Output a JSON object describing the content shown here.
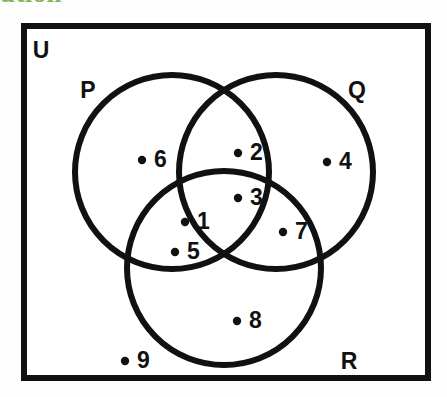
{
  "heading": {
    "clipped_text": "ution",
    "color": "#7aa845"
  },
  "diagram": {
    "type": "venn-3-set",
    "universal_set": {
      "label": "U",
      "border_color": "#111111"
    },
    "stroke_color": "#111111",
    "fill_color": "#ffffff",
    "sets": [
      {
        "id": "P",
        "label": "P",
        "cx": 172,
        "cy": 172,
        "r": 97
      },
      {
        "id": "Q",
        "label": "Q",
        "cx": 276,
        "cy": 172,
        "r": 97
      },
      {
        "id": "R",
        "label": "R",
        "cx": 224,
        "cy": 268,
        "r": 97
      }
    ],
    "set_label_positions": [
      {
        "label": "P",
        "x": 88,
        "y": 92
      },
      {
        "label": "Q",
        "x": 357,
        "y": 92
      },
      {
        "label": "R",
        "x": 349,
        "y": 363
      },
      {
        "label": "U",
        "x": 41,
        "y": 52
      }
    ],
    "elements": [
      {
        "value": "1",
        "region": "P-and-R-only",
        "x": 185,
        "y": 222
      },
      {
        "value": "2",
        "region": "P-and-Q-only",
        "x": 238,
        "y": 153
      },
      {
        "value": "3",
        "region": "P-and-Q-and-R",
        "x": 238,
        "y": 198
      },
      {
        "value": "4",
        "region": "Q-only",
        "x": 327,
        "y": 162
      },
      {
        "value": "5",
        "region": "P-and-R-only",
        "x": 175,
        "y": 252
      },
      {
        "value": "6",
        "region": "P-only",
        "x": 142,
        "y": 160
      },
      {
        "value": "7",
        "region": "Q-and-R-only",
        "x": 283,
        "y": 232
      },
      {
        "value": "8",
        "region": "R-only",
        "x": 237,
        "y": 321
      },
      {
        "value": "9",
        "region": "outside-all-sets",
        "x": 125,
        "y": 361
      }
    ],
    "region_contents": {
      "P_only": [
        "6"
      ],
      "Q_only": [
        "4"
      ],
      "R_only": [
        "8"
      ],
      "P_and_Q_only": [
        "2"
      ],
      "P_and_R_only": [
        "1",
        "5"
      ],
      "Q_and_R_only": [
        "7"
      ],
      "P_and_Q_and_R": [
        "3"
      ],
      "outside_all": [
        "9"
      ]
    }
  }
}
